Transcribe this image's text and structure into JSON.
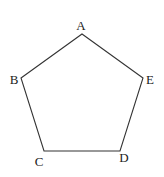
{
  "figure": {
    "type": "pentagon",
    "stroke_color": "#333333",
    "vertices": [
      {
        "label": "A",
        "x": 82,
        "y": 34,
        "lx": 81,
        "ly": 30
      },
      {
        "label": "E",
        "x": 143,
        "y": 78,
        "lx": 150,
        "ly": 84
      },
      {
        "label": "D",
        "x": 120,
        "y": 151,
        "lx": 124,
        "ly": 162
      },
      {
        "label": "C",
        "x": 44,
        "y": 151,
        "lx": 39,
        "ly": 166
      },
      {
        "label": "B",
        "x": 21,
        "y": 78,
        "lx": 14,
        "ly": 84
      }
    ]
  },
  "labels": {
    "A": "A",
    "B": "B",
    "C": "C",
    "D": "D",
    "E": "E"
  }
}
